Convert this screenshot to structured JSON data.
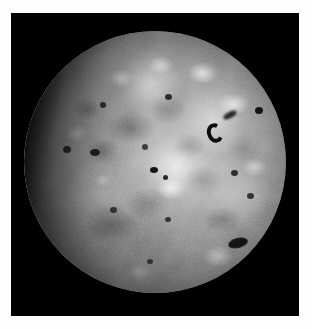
{
  "image": {
    "subject": "Io",
    "description": "Grayscale spacecraft image of Jupiter's volcanic moon Io, sunlit from the right with the terminator at the left limb",
    "kind": "photograph",
    "medium": "monochrome planetary imaging",
    "orientation": "portrait",
    "canvas": {
      "width": 312,
      "height": 329
    },
    "border": {
      "color": "#fefefe",
      "left": 11,
      "top": 13,
      "right": 13,
      "bottom": 13
    },
    "background": {
      "name": "space-background",
      "color": "#000000"
    },
    "disk": {
      "name": "moon-disk",
      "center_x": 155,
      "center_y": 162,
      "diameter": 262,
      "mean_color": "#8c8c8c",
      "highlight_color": "#f0f0f0",
      "shadow_color": "#101010"
    },
    "lighting": {
      "sun_direction": "upper-right",
      "terminator_side": "left",
      "limb_darkening": true
    },
    "features": [
      {
        "name": "caldera-major",
        "type": "dark-caldera",
        "x": 70,
        "y": 35,
        "size": 20,
        "note": "prominent hoof/horseshoe shaped dark volcanic feature"
      },
      {
        "name": "caldera-major-tail",
        "type": "dark-streak",
        "x": 76,
        "y": 31,
        "size": 14
      },
      {
        "name": "spot-upper-right",
        "type": "dark-spot",
        "x": 90,
        "y": 31,
        "size": 8
      },
      {
        "name": "spot-upper-center",
        "type": "dark-spot",
        "x": 55,
        "y": 25,
        "size": 7
      },
      {
        "name": "spot-center-left",
        "type": "dark-spot",
        "x": 30,
        "y": 28,
        "size": 6
      },
      {
        "name": "spot-mid-left",
        "type": "dark-spot",
        "x": 27,
        "y": 46,
        "size": 9
      },
      {
        "name": "spot-center",
        "type": "dark-spot",
        "x": 46,
        "y": 44,
        "size": 6
      },
      {
        "name": "spot-core-a",
        "type": "dark-spot",
        "x": 49,
        "y": 53,
        "size": 7
      },
      {
        "name": "spot-core-b",
        "type": "dark-spot",
        "x": 54,
        "y": 55,
        "size": 5
      },
      {
        "name": "spot-right-mid",
        "type": "dark-spot",
        "x": 80,
        "y": 54,
        "size": 6
      },
      {
        "name": "spot-right-low",
        "type": "dark-spot",
        "x": 86,
        "y": 63,
        "size": 6
      },
      {
        "name": "spot-lower-center",
        "type": "dark-spot",
        "x": 55,
        "y": 72,
        "size": 6
      },
      {
        "name": "spot-lower-left",
        "type": "dark-spot",
        "x": 34,
        "y": 68,
        "size": 6
      },
      {
        "name": "spot-bottom",
        "type": "dark-spot",
        "x": 48,
        "y": 88,
        "size": 5
      },
      {
        "name": "caldera-lower-right",
        "type": "dark-caldera",
        "x": 82,
        "y": 81,
        "size": 16,
        "note": "elongated dark patch near the lower right limb"
      },
      {
        "name": "spot-terminator",
        "type": "dark-spot",
        "x": 16,
        "y": 45,
        "size": 7
      },
      {
        "name": "bright-plain-north",
        "type": "bright-plain",
        "x": 68,
        "y": 16,
        "size": 18
      },
      {
        "name": "bright-plain-northeast",
        "type": "bright-plain",
        "x": 80,
        "y": 28,
        "size": 20
      },
      {
        "name": "bright-plain-equator",
        "type": "bright-plain",
        "x": 58,
        "y": 52,
        "size": 38
      },
      {
        "name": "bright-plain-southeast",
        "type": "bright-plain",
        "x": 74,
        "y": 86,
        "size": 18
      }
    ]
  },
  "caption": {
    "title": "Io",
    "text": ""
  }
}
